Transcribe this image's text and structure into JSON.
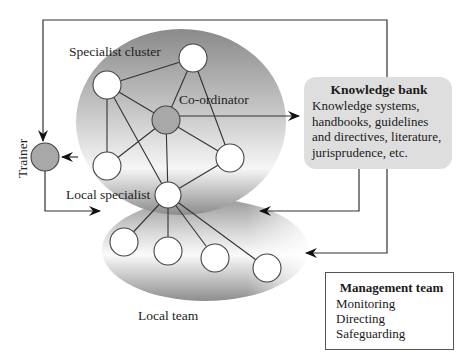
{
  "diagram": {
    "labels": {
      "specialist_cluster": "Specialist cluster",
      "coordinator": "Co-ordinator",
      "local_specialist": "Local specialist",
      "local_team": "Local team",
      "trainer": "Trainer"
    },
    "knowledge_bank": {
      "title": "Knowledge bank",
      "lines": [
        "Knowledge systems,",
        "handbooks, guidelines",
        "and directives, literature,",
        "jurisprudence, etc."
      ]
    },
    "management_team": {
      "title": "Management team",
      "items": [
        "Monitoring",
        "Directing",
        "Safeguarding"
      ]
    },
    "colors": {
      "node_fill": "#ffffff",
      "highlight_node_fill": "#a8a8a8",
      "line": "#333333",
      "knowledge_bank_fill": "#dedede",
      "cluster_shade_dark": "#9a9a9a",
      "cluster_shade_light": "#ffffff"
    }
  }
}
